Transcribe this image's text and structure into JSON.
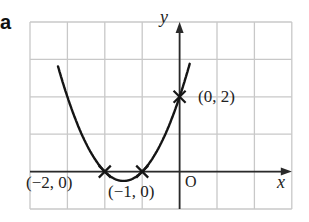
{
  "part_label": "a",
  "chart_data": {
    "type": "line",
    "title": "",
    "function": "y = x^2 + 3x + 2",
    "xlabel": "x",
    "ylabel": "y",
    "origin_label": "O",
    "xlim": [
      -4,
      3
    ],
    "ylim": [
      -1,
      4
    ],
    "grid": true,
    "grid_step": 1,
    "points": [
      {
        "x": -2,
        "y": 0,
        "label": "(−2, 0)"
      },
      {
        "x": -1,
        "y": 0,
        "label": "(−1, 0)"
      },
      {
        "x": 0,
        "y": 2,
        "label": "(0, 2)"
      }
    ]
  },
  "colors": {
    "grid": "#c8c8c8",
    "axis": "#2a2a2a",
    "curve": "#151515"
  }
}
